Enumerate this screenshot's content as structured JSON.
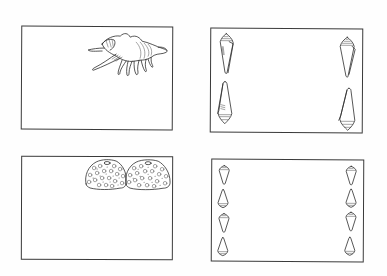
{
  "sheet": {
    "background": "#ffffff",
    "ink_color": "#2e2e2e"
  },
  "cards": [
    {
      "id": "card-murex",
      "position": "top-left",
      "decoration": "murex-shell-icon",
      "decoration_count": 1,
      "decoration_placement": "top-right"
    },
    {
      "id": "card-cone-large",
      "position": "top-right",
      "decoration": "cone-shell-icon",
      "decoration_count": 4,
      "decoration_placement": "left-and-right-edges"
    },
    {
      "id": "card-urchin",
      "position": "bottom-left",
      "decoration": "sea-urchin-icon",
      "decoration_count": 2,
      "decoration_placement": "top-right"
    },
    {
      "id": "card-cone-small",
      "position": "bottom-right",
      "decoration": "cone-shell-icon",
      "decoration_count": 8,
      "decoration_placement": "left-and-right-edges"
    }
  ]
}
